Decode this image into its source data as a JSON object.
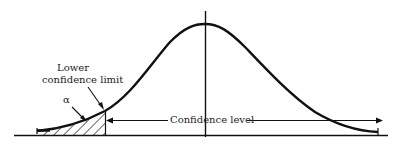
{
  "diagram": {
    "labels": {
      "lower_limit_line1": "Lower",
      "lower_limit_line2": "confidence limit",
      "alpha": "α",
      "confidence_level": "Confidence level"
    },
    "colors": {
      "stroke": "#111111",
      "background": "#ffffff"
    }
  }
}
